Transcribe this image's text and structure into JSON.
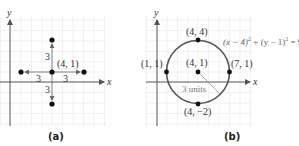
{
  "panels": [
    {
      "id": "a",
      "caption": "(a)",
      "x_axis_label": "x",
      "y_axis_label": "y",
      "center_label": "(4, 1)",
      "distance_labels": {
        "up": "3",
        "left": "3",
        "right": "3",
        "down": "3"
      },
      "points": [
        {
          "name": "center",
          "coord": [
            4,
            1
          ]
        },
        {
          "name": "left",
          "coord": [
            1,
            1
          ]
        },
        {
          "name": "right",
          "coord": [
            7,
            1
          ]
        },
        {
          "name": "top",
          "coord": [
            4,
            4
          ]
        },
        {
          "name": "bottom",
          "coord": [
            4,
            -2
          ]
        }
      ]
    },
    {
      "id": "b",
      "caption": "(b)",
      "x_axis_label": "x",
      "y_axis_label": "y",
      "point_labels": {
        "top": "(4, 4)",
        "center": "(4, 1)",
        "right": "(7, 1)",
        "left": "(1, 1)",
        "bottom": "(4, −2)"
      },
      "radius_label": "3 units",
      "equation": {
        "part1": "(x − 4)",
        "exp1": "2",
        "part2": " + (y − 1)",
        "exp2": "2",
        "part3": " = 9"
      },
      "circle": {
        "center": [
          4,
          1
        ],
        "radius": 3
      }
    }
  ],
  "colors": {
    "axis": "#555555",
    "grid": "#e8e8e8",
    "point": "#111111",
    "circle": "#555555",
    "label": "#333333"
  }
}
